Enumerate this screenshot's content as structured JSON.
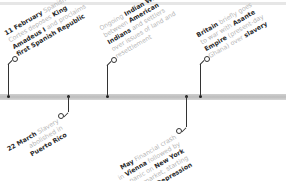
{
  "timeline": {
    "colors": {
      "bar": "#c4c4c4",
      "connector": "#333333",
      "bold_text": "#2a2a2a",
      "light_text": "#b5b5b5"
    },
    "events": [
      {
        "position": "above",
        "lines": [
          [
            {
              "t": "11 February",
              "b": true
            },
            {
              "t": " Spanish",
              "b": false
            }
          ],
          [
            {
              "t": "Cortes deposes ",
              "b": false
            },
            {
              "t": "King",
              "b": true
            }
          ],
          [
            {
              "t": "Amadeus I",
              "b": true
            },
            {
              "t": " and proclaims",
              "b": false
            }
          ],
          [
            {
              "t": "first Spanish Republic",
              "b": true
            }
          ]
        ]
      },
      {
        "position": "below",
        "lines": [
          [
            {
              "t": "22 March",
              "b": true
            },
            {
              "t": " Slavery",
              "b": false
            }
          ],
          [
            {
              "t": "abolished in",
              "b": false
            }
          ],
          [
            {
              "t": "Puerto Rico",
              "b": true
            }
          ]
        ]
      },
      {
        "position": "above",
        "lines": [
          [
            {
              "t": "Ongoing ",
              "b": false
            },
            {
              "t": "Indian Wars",
              "b": true
            }
          ],
          [
            {
              "t": "between ",
              "b": false
            },
            {
              "t": "American",
              "b": true
            }
          ],
          [
            {
              "t": "Indians",
              "b": true
            },
            {
              "t": " and settlers",
              "b": false
            }
          ],
          [
            {
              "t": "over issues of land and",
              "b": false
            }
          ],
          [
            {
              "t": "resettlement",
              "b": false
            }
          ]
        ]
      },
      {
        "position": "below",
        "lines": [
          [
            {
              "t": "May",
              "b": true
            },
            {
              "t": " Financial crash",
              "b": false
            }
          ],
          [
            {
              "t": "in ",
              "b": false
            },
            {
              "t": "Vienna",
              "b": true
            },
            {
              "t": " followed by",
              "b": false
            }
          ],
          [
            {
              "t": "later panic on ",
              "b": false
            },
            {
              "t": "New York",
              "b": true
            }
          ],
          [
            {
              "t": "stock market, starting",
              "b": false
            }
          ],
          [
            {
              "t": "Long Depression",
              "b": true
            }
          ]
        ]
      },
      {
        "position": "above",
        "lines": [
          [
            {
              "t": "Britain",
              "b": true
            },
            {
              "t": " briefly goes",
              "b": false
            }
          ],
          [
            {
              "t": "to war with ",
              "b": false
            },
            {
              "t": "Asante",
              "b": true
            }
          ],
          [
            {
              "t": "Empire",
              "b": true
            },
            {
              "t": " (present-day",
              "b": false
            }
          ],
          [
            {
              "t": "Ghana) over ",
              "b": false
            },
            {
              "t": "slavery",
              "b": true
            }
          ]
        ]
      }
    ]
  }
}
